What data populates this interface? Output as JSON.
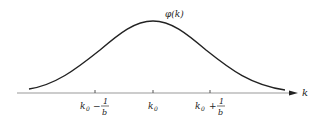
{
  "figure": {
    "curve_label": "φ(k)",
    "axis_label": "k",
    "ticks": [
      {
        "main": "k",
        "sub": "0",
        "op": "−",
        "num": "1",
        "den": "b"
      },
      {
        "main": "k",
        "sub": "0"
      },
      {
        "main": "k",
        "sub": "0",
        "op": "+",
        "num": "1",
        "den": "b"
      }
    ],
    "colors": {
      "curve": "#222222",
      "axis": "#9a9a9a",
      "text": "#222222"
    }
  }
}
